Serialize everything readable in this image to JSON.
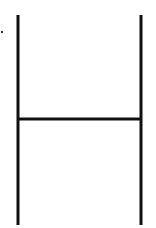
{
  "diagram": {
    "type": "line-figure",
    "shape": "H",
    "stroke_color": "#111111",
    "background": "#ffffff",
    "elements": [
      {
        "name": "left-post",
        "x1": 18,
        "y1": 15,
        "x2": 18,
        "y2": 225,
        "width": 3
      },
      {
        "name": "right-post",
        "x1": 141,
        "y1": 15,
        "x2": 141,
        "y2": 225,
        "width": 3
      },
      {
        "name": "crossbar",
        "x1": 18,
        "y1": 119,
        "x2": 141,
        "y2": 119,
        "width": 3
      }
    ],
    "marker": {
      "name": "dot",
      "cx": 2,
      "cy": 32,
      "r": 1.2
    }
  }
}
